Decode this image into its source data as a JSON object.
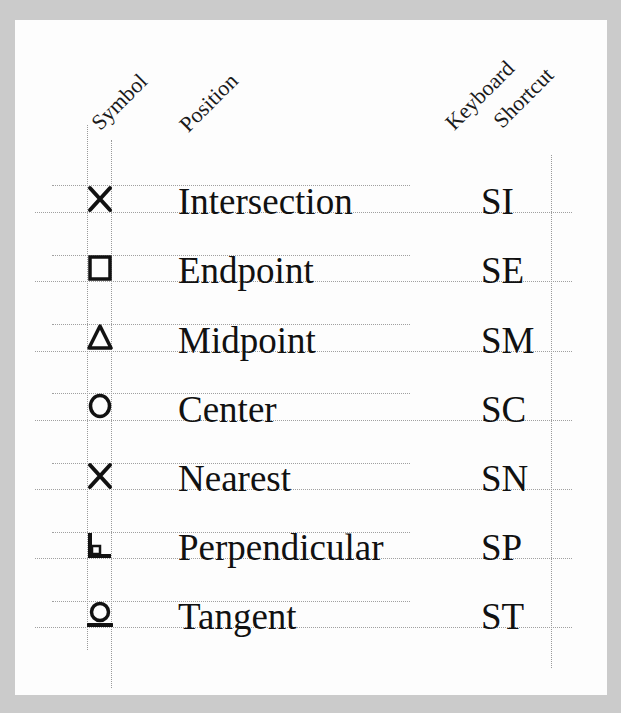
{
  "headers": {
    "symbol": "Symbol",
    "position": "Position",
    "keyboard_line1": "Keyboard",
    "keyboard_line2": "Shortcut"
  },
  "rows": [
    {
      "symbol": "x-icon",
      "position": "Intersection",
      "shortcut": "SI"
    },
    {
      "symbol": "square-icon",
      "position": "Endpoint",
      "shortcut": "SE"
    },
    {
      "symbol": "triangle-icon",
      "position": "Midpoint",
      "shortcut": "SM"
    },
    {
      "symbol": "circle-icon",
      "position": "Center",
      "shortcut": "SC"
    },
    {
      "symbol": "x-icon",
      "position": "Nearest",
      "shortcut": "SN"
    },
    {
      "symbol": "perpendicular-icon",
      "position": "Perpendicular",
      "shortcut": "SP"
    },
    {
      "symbol": "tangent-icon",
      "position": "Tangent",
      "shortcut": "ST"
    }
  ],
  "colors": {
    "background": "#cbcbcb",
    "page": "#fdfdfd",
    "ink": "#111111",
    "rule": "#a0a0a0"
  }
}
